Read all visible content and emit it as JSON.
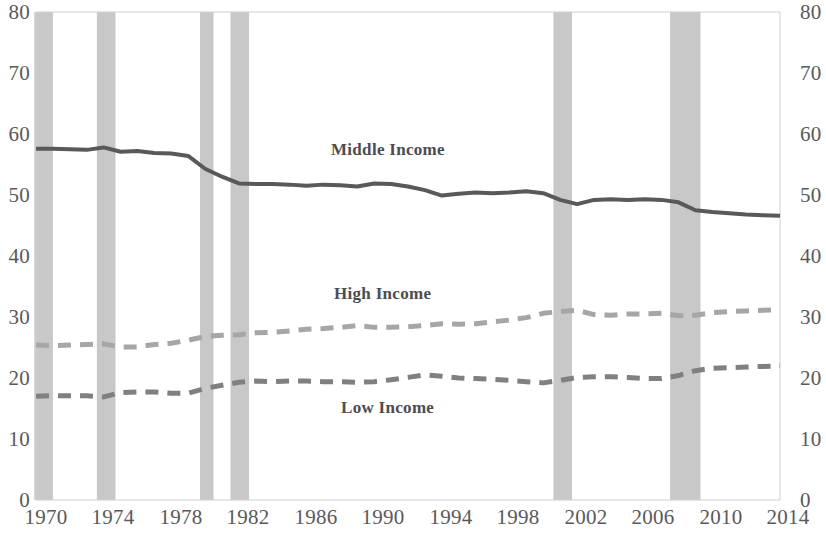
{
  "chart_data": {
    "type": "line",
    "title": "",
    "subtitle": "",
    "xlabel": "",
    "ylabel": "",
    "xlim": [
      1970,
      2014
    ],
    "ylim": [
      0,
      80
    ],
    "y_ticks": [
      0,
      10,
      20,
      30,
      40,
      50,
      60,
      70,
      80
    ],
    "x_ticks": [
      1970,
      1974,
      1978,
      1982,
      1986,
      1990,
      1994,
      1998,
      2002,
      2006,
      2010,
      2014
    ],
    "grid": false,
    "legend_position": "inline-annotations",
    "dual_y_axis": true,
    "x": [
      1970,
      1971,
      1972,
      1973,
      1974,
      1975,
      1976,
      1977,
      1978,
      1979,
      1980,
      1981,
      1982,
      1983,
      1984,
      1985,
      1986,
      1987,
      1988,
      1989,
      1990,
      1991,
      1992,
      1993,
      1994,
      1995,
      1996,
      1997,
      1998,
      1999,
      2000,
      2001,
      2002,
      2003,
      2004,
      2005,
      2006,
      2007,
      2008,
      2009,
      2010,
      2011,
      2012,
      2013,
      2014
    ],
    "series": [
      {
        "name": "Middle Income",
        "style": "solid",
        "color": "#595959",
        "label_x": 1988,
        "label_y": 62,
        "values": [
          57.6,
          57.6,
          57.5,
          57.4,
          57.8,
          57.1,
          57.2,
          56.9,
          56.8,
          56.4,
          54.3,
          53.0,
          51.9,
          51.8,
          51.8,
          51.7,
          51.5,
          51.7,
          51.6,
          51.4,
          51.9,
          51.8,
          51.4,
          50.8,
          49.9,
          50.2,
          50.4,
          50.3,
          50.4,
          50.6,
          50.3,
          49.2,
          48.5,
          49.2,
          49.3,
          49.2,
          49.3,
          49.2,
          48.8,
          47.5,
          47.2,
          47.0,
          46.8,
          46.7,
          46.6
        ]
      },
      {
        "name": "High Income",
        "style": "dashed",
        "color": "#a6a6a6",
        "label_x": 1988,
        "label_y": 34,
        "values": [
          25.4,
          25.3,
          25.4,
          25.5,
          25.6,
          25.1,
          25.1,
          25.5,
          25.7,
          26.2,
          26.8,
          27.0,
          27.1,
          27.4,
          27.5,
          27.7,
          28.0,
          28.1,
          28.3,
          28.6,
          28.3,
          28.3,
          28.4,
          28.6,
          28.9,
          28.8,
          28.9,
          29.2,
          29.5,
          29.9,
          30.6,
          30.9,
          31.1,
          30.4,
          30.3,
          30.5,
          30.5,
          30.6,
          30.2,
          30.3,
          30.7,
          30.9,
          31.0,
          31.1,
          31.2
        ]
      },
      {
        "name": "Low Income",
        "style": "dashed",
        "color": "#808080",
        "label_x": 1990,
        "label_y": 14,
        "values": [
          17.0,
          17.1,
          17.1,
          17.1,
          16.9,
          17.6,
          17.7,
          17.7,
          17.5,
          17.5,
          18.3,
          18.8,
          19.3,
          19.5,
          19.4,
          19.5,
          19.5,
          19.4,
          19.4,
          19.3,
          19.4,
          19.7,
          20.1,
          20.5,
          20.3,
          20.0,
          19.9,
          19.8,
          19.6,
          19.4,
          19.2,
          19.6,
          20.1,
          20.2,
          20.2,
          20.1,
          19.9,
          19.9,
          20.4,
          21.2,
          21.6,
          21.7,
          21.8,
          21.9,
          22.0
        ]
      }
    ],
    "recession_bands": [
      {
        "start": 1969.9,
        "end": 1971.0
      },
      {
        "start": 1973.6,
        "end": 1974.7
      },
      {
        "start": 1979.7,
        "end": 1980.5
      },
      {
        "start": 1981.5,
        "end": 1982.6
      },
      {
        "start": 2000.6,
        "end": 1000.0
      },
      {
        "start": 2000.6,
        "end": 2001.7
      },
      {
        "start": 2007.5,
        "end": 2009.3
      }
    ],
    "band_color": "#c8c8c8",
    "axis_color": "#d4d0c8",
    "background": "#ffffff"
  },
  "axes": {
    "left_ticks": [
      "80",
      "70",
      "60",
      "50",
      "40",
      "30",
      "20",
      "10",
      "0"
    ],
    "right_ticks": [
      "80",
      "70",
      "60",
      "50",
      "40",
      "30",
      "20",
      "10",
      "0"
    ],
    "x_ticks": [
      "1970",
      "1974",
      "1978",
      "1982",
      "1986",
      "1990",
      "1994",
      "1998",
      "2002",
      "2006",
      "2010",
      "2014"
    ]
  },
  "annotations": {
    "middle_income": "Middle Income",
    "high_income": "High Income",
    "low_income": "Low Income"
  }
}
